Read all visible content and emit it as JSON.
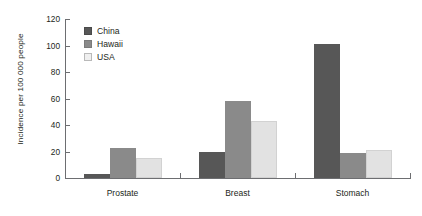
{
  "chart_data": {
    "type": "bar",
    "title": "",
    "xlabel": "",
    "ylabel": "Incidence per 100 000 people",
    "ylim": [
      0,
      120
    ],
    "ytick_labels": [
      "0",
      "20",
      "40",
      "60",
      "80",
      "100",
      "120"
    ],
    "ytick_values": [
      0,
      20,
      40,
      60,
      80,
      100,
      120
    ],
    "grid": false,
    "legend_position": "upper-left-inside",
    "categories": [
      "Prostate",
      "Breast",
      "Stomach"
    ],
    "series": [
      {
        "name": "China",
        "color": "#575757",
        "values": [
          3,
          20,
          101
        ]
      },
      {
        "name": "Hawaii",
        "color": "#8a8a8a",
        "values": [
          23,
          58,
          19
        ]
      },
      {
        "name": "USA",
        "color": "#e2e2e2",
        "values": [
          15,
          43,
          21
        ]
      }
    ]
  },
  "legend": {
    "items": [
      {
        "label": "China",
        "swatch": "legend-swatch-china"
      },
      {
        "label": "Hawaii",
        "swatch": "legend-swatch-hawaii"
      },
      {
        "label": "USA",
        "swatch": "legend-swatch-usa"
      }
    ]
  },
  "axes": {
    "y_title": "Incidence per 100 000 people",
    "y_labels": [
      "120",
      "100",
      "80",
      "60",
      "40",
      "20",
      "0"
    ],
    "x_labels": [
      "Prostate",
      "Breast",
      "Stomach"
    ]
  }
}
